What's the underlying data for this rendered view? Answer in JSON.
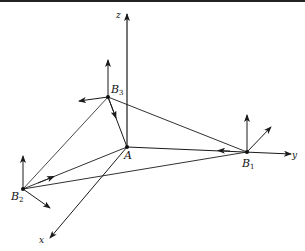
{
  "figure": {
    "type": "3d-vector-diagram",
    "axes": [
      {
        "name": "x",
        "label": "x"
      },
      {
        "name": "y",
        "label": "y"
      },
      {
        "name": "z",
        "label": "z"
      }
    ],
    "points": [
      {
        "id": "A",
        "label": "A",
        "subscript": ""
      },
      {
        "id": "B1",
        "label": "B",
        "subscript": "1"
      },
      {
        "id": "B2",
        "label": "B",
        "subscript": "2"
      },
      {
        "id": "B3",
        "label": "B",
        "subscript": "3"
      }
    ],
    "connections": [
      [
        "B3",
        "A"
      ],
      [
        "B3",
        "B1"
      ],
      [
        "B3",
        "B2"
      ],
      [
        "A",
        "B1"
      ],
      [
        "A",
        "B2"
      ],
      [
        "B2",
        "B1"
      ]
    ],
    "local_frames": [
      "B1",
      "B2",
      "B3"
    ],
    "line_color": "#1a1a1a"
  }
}
